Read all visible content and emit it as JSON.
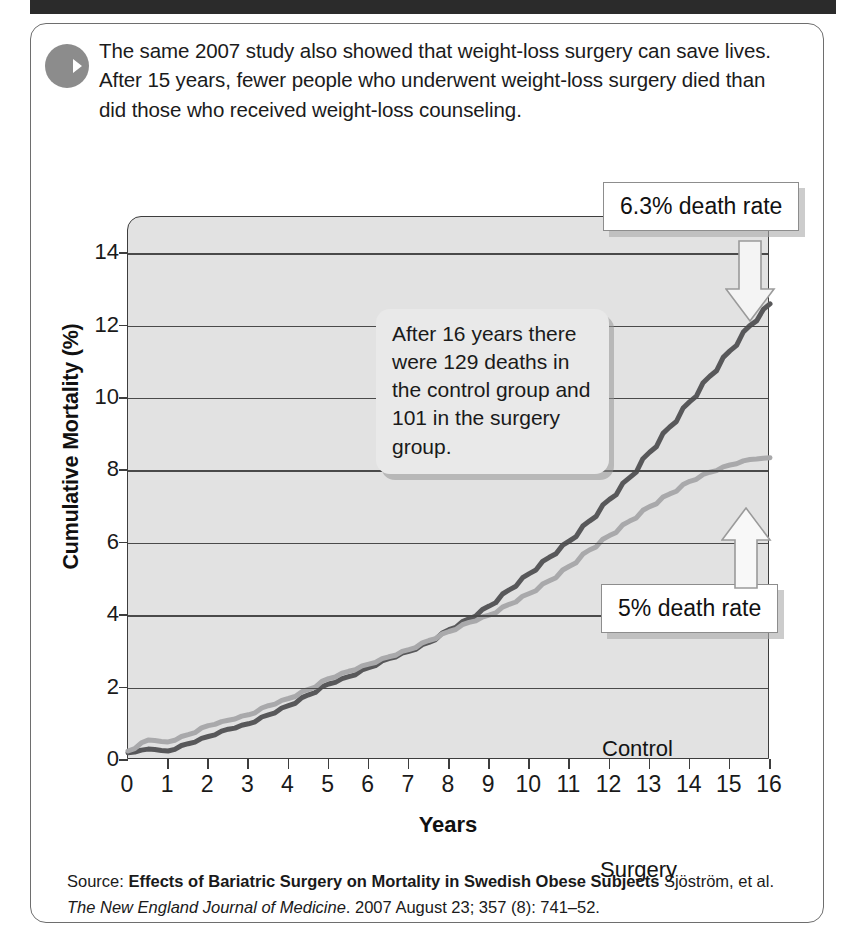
{
  "banner": {
    "text": ""
  },
  "intro": {
    "icon": "arrow-right-circle-icon",
    "text": "The same 2007 study also showed that weight-loss surgery can save lives. After 15 years, fewer people who underwent weight-loss surgery died than did those who received weight-loss counseling."
  },
  "note": {
    "text": "After 16 years there were 129 deaths in the control group and 101 in the surgery group."
  },
  "callouts": {
    "control_rate": "6.3% death rate",
    "surgery_rate": "5% death rate"
  },
  "source": {
    "prefix": "Source:",
    "title": "Effects of Bariatric Surgery on Mortality in Swedish Obese Subjects",
    "authors": "Sjöström, et al.",
    "journal": "The New England Journal of Medicine",
    "citation": ". 2007 August 23; 357 (8): 741–52."
  },
  "colors": {
    "control_line": "#58585a",
    "surgery_line": "#a9a9ab",
    "plot_background": "#e2e2e2",
    "axis": "#3d3d3d",
    "banner": "#2b2b2b"
  },
  "chart_data": {
    "type": "line",
    "title": "",
    "xlabel": "Years",
    "ylabel": "Cumulative Mortality (%)",
    "xlim": [
      0,
      16
    ],
    "ylim": [
      0,
      15
    ],
    "yticks": [
      0,
      2,
      4,
      6,
      8,
      10,
      12,
      14
    ],
    "xticks": [
      0,
      1,
      2,
      3,
      4,
      5,
      6,
      7,
      8,
      9,
      10,
      11,
      12,
      13,
      14,
      15,
      16
    ],
    "grid": true,
    "legend_position": "inline-labels",
    "annotations": [
      {
        "text": "After 16 years there were 129 deaths in the control group and 101 in the surgery group.",
        "x": 8.5,
        "y": 11
      },
      {
        "text": "6.3% death rate",
        "x": 16,
        "y": 12.6,
        "points_to": "control-endpoint"
      },
      {
        "text": "5% death rate",
        "x": 16,
        "y": 8.3,
        "points_to": "surgery-endpoint"
      }
    ],
    "x": [
      0,
      0.5,
      1,
      1.5,
      2,
      2.5,
      3,
      3.5,
      4,
      4.5,
      5,
      5.5,
      6,
      6.5,
      7,
      7.5,
      8,
      8.5,
      9,
      9.5,
      10,
      10.5,
      11,
      11.5,
      12,
      12.5,
      13,
      13.5,
      14,
      14.5,
      15,
      15.5,
      16
    ],
    "series": [
      {
        "name": "Control",
        "color": "#58585a",
        "values": [
          0.2,
          0.3,
          0.25,
          0.45,
          0.65,
          0.85,
          1.0,
          1.25,
          1.5,
          1.8,
          2.1,
          2.3,
          2.55,
          2.8,
          3.0,
          3.25,
          3.6,
          3.9,
          4.25,
          4.7,
          5.15,
          5.6,
          6.05,
          6.6,
          7.2,
          7.8,
          8.5,
          9.2,
          9.9,
          10.6,
          11.3,
          12.0,
          12.6
        ]
      },
      {
        "name": "Surgery",
        "color": "#a9a9ab",
        "values": [
          0.25,
          0.55,
          0.5,
          0.7,
          0.95,
          1.1,
          1.25,
          1.5,
          1.7,
          1.95,
          2.25,
          2.45,
          2.65,
          2.85,
          3.05,
          3.3,
          3.55,
          3.8,
          4.0,
          4.3,
          4.6,
          4.95,
          5.35,
          5.8,
          6.2,
          6.6,
          7.0,
          7.35,
          7.7,
          7.95,
          8.15,
          8.3,
          8.35
        ]
      }
    ]
  }
}
